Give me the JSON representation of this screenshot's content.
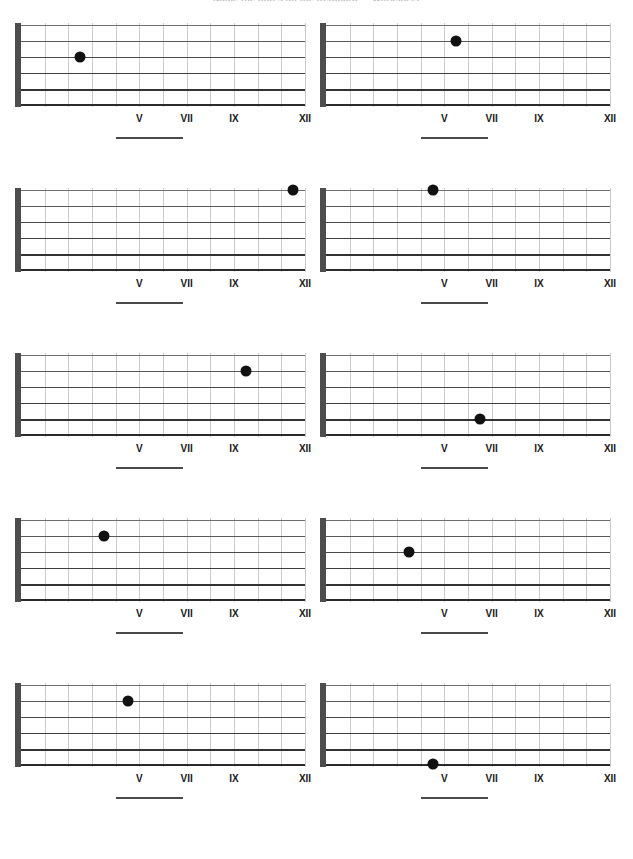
{
  "title": "Name the notes on the fretboard — Worksheet",
  "worksheet": {
    "string_count": 6,
    "fret_count": 12,
    "fret_marker_labels": [
      {
        "fret": 5,
        "label": "V"
      },
      {
        "fret": 7,
        "label": "VII"
      },
      {
        "fret": 9,
        "label": "IX"
      },
      {
        "fret": 12,
        "label": "XII"
      }
    ],
    "answer_blank_label": "",
    "colors": {
      "nut": "#4d4d4d",
      "string": "#2b2b2b",
      "fret": "#c9c9c9",
      "dot": "#111111",
      "label": "#1a1a1a",
      "blank": "#4a4a4a",
      "background": "#ffffff"
    }
  },
  "diagrams": [
    {
      "id": 1,
      "position": "row1-left",
      "string": 3,
      "fret": 3,
      "dot_x_pct": 24.0,
      "dot_y_string": 3
    },
    {
      "id": 2,
      "position": "row1-right",
      "string": 2,
      "fret": 6,
      "dot_x_pct": 48.5,
      "dot_y_string": 2
    },
    {
      "id": 3,
      "position": "row2-left",
      "string": 1,
      "fret": 12,
      "dot_x_pct": 96.5,
      "dot_y_string": 1
    },
    {
      "id": 4,
      "position": "row2-right",
      "string": 1,
      "fret": 5,
      "dot_x_pct": 40.5,
      "dot_y_string": 1
    },
    {
      "id": 5,
      "position": "row3-left",
      "string": 2,
      "fret": 10,
      "dot_x_pct": 80.5,
      "dot_y_string": 2
    },
    {
      "id": 6,
      "position": "row3-right",
      "string": 5,
      "fret": 7,
      "dot_x_pct": 56.5,
      "dot_y_string": 5
    },
    {
      "id": 7,
      "position": "row4-left",
      "string": 2,
      "fret": 4,
      "dot_x_pct": 32.5,
      "dot_y_string": 2
    },
    {
      "id": 8,
      "position": "row4-right",
      "string": 3,
      "fret": 4,
      "dot_x_pct": 32.5,
      "dot_y_string": 3
    },
    {
      "id": 9,
      "position": "row5-left",
      "string": 2,
      "fret": 5,
      "dot_x_pct": 40.5,
      "dot_y_string": 2
    },
    {
      "id": 10,
      "position": "row5-right",
      "string": 6,
      "fret": 5,
      "dot_x_pct": 40.5,
      "dot_y_string": 6
    }
  ],
  "row_tops": [
    0,
    165,
    330,
    495,
    660
  ]
}
